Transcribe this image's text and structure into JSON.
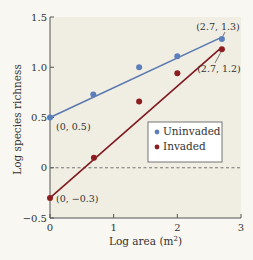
{
  "chart_data": {
    "type": "scatter",
    "title": "",
    "xlabel": "Log area (m²)",
    "xlabel_parts": {
      "base": "Log area (m",
      "sup": "2",
      "end": ")"
    },
    "ylabel": "Log species richness",
    "xlim": [
      0,
      3
    ],
    "ylim": [
      -0.5,
      1.5
    ],
    "x_ticks": [
      0,
      1,
      2,
      3
    ],
    "x_tick_labels": [
      "0",
      "1",
      "2",
      "3"
    ],
    "y_ticks": [
      -0.5,
      0,
      0.5,
      1.0,
      1.5
    ],
    "y_tick_labels": [
      "−0.5",
      "0",
      "0.5",
      "1.0",
      "1.5"
    ],
    "grid": false,
    "reference_line": {
      "y": 0,
      "style": "dashed"
    },
    "legend_position": "lower right (inside plot)",
    "series": [
      {
        "name": "Uninvaded",
        "color": "#5b7fbd",
        "line_color": "#5a79b0",
        "points": [
          {
            "x": 0,
            "y": 0.5
          },
          {
            "x": 0.68,
            "y": 0.73
          },
          {
            "x": 1.4,
            "y": 1.0
          },
          {
            "x": 2.0,
            "y": 1.11
          },
          {
            "x": 2.7,
            "y": 1.28
          }
        ],
        "fit_line": {
          "x0": 0,
          "y0": 0.5,
          "x1": 2.7,
          "y1": 1.3
        }
      },
      {
        "name": "Invaded",
        "color": "#8e1d22",
        "line_color": "#7f1a1f",
        "points": [
          {
            "x": 0,
            "y": -0.3
          },
          {
            "x": 0.69,
            "y": 0.1
          },
          {
            "x": 1.4,
            "y": 0.66
          },
          {
            "x": 2.0,
            "y": 0.94
          },
          {
            "x": 2.7,
            "y": 1.18
          }
        ],
        "fit_line": {
          "x0": 0,
          "y0": -0.3,
          "x1": 2.7,
          "y1": 1.2
        }
      }
    ],
    "annotations": [
      {
        "text": "(0, 0.5)",
        "x": 0,
        "y": 0.5
      },
      {
        "text": "(0, −0.3)",
        "x": 0,
        "y": -0.3
      },
      {
        "text": "(2.7, 1.3)",
        "x": 2.7,
        "y": 1.3
      },
      {
        "text": "(2.7, 1.2)",
        "x": 2.7,
        "y": 1.2
      }
    ]
  },
  "colors": {
    "page_background": "#f8f7f2",
    "plot_background": "#f0ede2",
    "axis": "#555555",
    "uninvaded": "#5b7fbd",
    "invaded": "#8e1d22"
  }
}
